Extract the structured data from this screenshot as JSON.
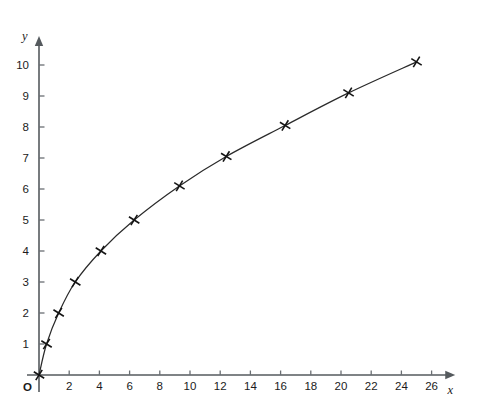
{
  "chart_data": {
    "type": "line",
    "title": "",
    "subtitle": "",
    "xlabel": "x",
    "ylabel": "y",
    "origin_label": "O",
    "xlim": [
      0,
      27.5
    ],
    "ylim": [
      0,
      10.9
    ],
    "grid": false,
    "legend": null,
    "x_ticks": [
      2,
      4,
      6,
      8,
      10,
      12,
      14,
      16,
      18,
      20,
      22,
      24,
      26
    ],
    "x_tick_labels": [
      "2",
      "4",
      "6",
      "8",
      "10",
      "12",
      "14",
      "16",
      "18",
      "20",
      "22",
      "24",
      "26"
    ],
    "y_ticks": [
      1,
      2,
      3,
      4,
      5,
      6,
      7,
      8,
      9,
      10
    ],
    "y_tick_labels": [
      "1",
      "2",
      "3",
      "4",
      "5",
      "6",
      "7",
      "8",
      "9",
      "10"
    ],
    "marker_style": "cross",
    "series": [
      {
        "name": "curve",
        "x": [
          0,
          0.5,
          1.3,
          2.4,
          4.1,
          6.3,
          9.3,
          12.4,
          16.3,
          20.5,
          25.0
        ],
        "y": [
          0,
          1.0,
          2.0,
          3.0,
          4.0,
          5.0,
          6.1,
          7.05,
          8.05,
          9.1,
          10.1
        ]
      }
    ],
    "annotations": []
  },
  "colors": {
    "background": "#ffffff",
    "axis": "#555a5e",
    "tick": "#6a6f73",
    "curve": "#2a2a2a",
    "marker": "#141414",
    "text": "#1b1b1b"
  }
}
